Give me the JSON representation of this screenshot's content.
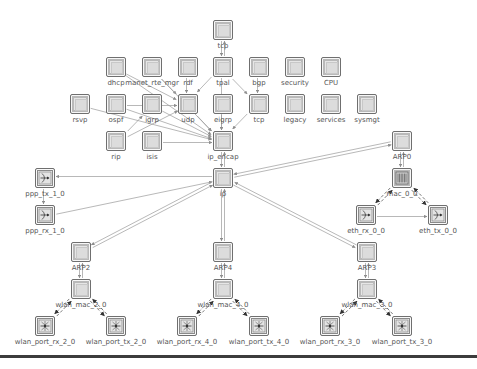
{
  "diagram": {
    "nodes": [
      {
        "id": "top",
        "label": "tcp",
        "x": 213,
        "y": 20,
        "type": "module"
      },
      {
        "id": "dhcp",
        "label": "dhcp",
        "x": 106,
        "y": 57,
        "type": "module"
      },
      {
        "id": "manet",
        "label": "manet_rte_mgr",
        "x": 142,
        "y": 57,
        "type": "module"
      },
      {
        "id": "rdf",
        "label": "rdf",
        "x": 178,
        "y": 57,
        "type": "module"
      },
      {
        "id": "tpal",
        "label": "tpal",
        "x": 213,
        "y": 57,
        "type": "module"
      },
      {
        "id": "bgp",
        "label": "bgp",
        "x": 249,
        "y": 57,
        "type": "module"
      },
      {
        "id": "security",
        "label": "security",
        "x": 285,
        "y": 57,
        "type": "module"
      },
      {
        "id": "cpu",
        "label": "CPU",
        "x": 321,
        "y": 57,
        "type": "module"
      },
      {
        "id": "rsvp",
        "label": "rsvp",
        "x": 70,
        "y": 94,
        "type": "module"
      },
      {
        "id": "ospf",
        "label": "ospf",
        "x": 106,
        "y": 94,
        "type": "module"
      },
      {
        "id": "igrp",
        "label": "igrp",
        "x": 142,
        "y": 94,
        "type": "module"
      },
      {
        "id": "udp",
        "label": "udp",
        "x": 178,
        "y": 94,
        "type": "module"
      },
      {
        "id": "eigrp",
        "label": "eigrp",
        "x": 213,
        "y": 94,
        "type": "module"
      },
      {
        "id": "tcp",
        "label": "tcp",
        "x": 249,
        "y": 94,
        "type": "module"
      },
      {
        "id": "legacy",
        "label": "legacy",
        "x": 285,
        "y": 94,
        "type": "module"
      },
      {
        "id": "services",
        "label": "services",
        "x": 321,
        "y": 94,
        "type": "module"
      },
      {
        "id": "sysmgt",
        "label": "sysmgt",
        "x": 357,
        "y": 94,
        "type": "module"
      },
      {
        "id": "rip",
        "label": "rip",
        "x": 106,
        "y": 131,
        "type": "module"
      },
      {
        "id": "isis",
        "label": "isis",
        "x": 142,
        "y": 131,
        "type": "module"
      },
      {
        "id": "ip_encap",
        "label": "ip_encap",
        "x": 213,
        "y": 131,
        "type": "module"
      },
      {
        "id": "arp0",
        "label": "ARP0",
        "x": 392,
        "y": 131,
        "type": "module"
      },
      {
        "id": "ppp_tx",
        "label": "ppp_tx_1_0",
        "x": 35,
        "y": 168,
        "type": "ptx"
      },
      {
        "id": "ip",
        "label": "ip",
        "x": 213,
        "y": 168,
        "type": "module"
      },
      {
        "id": "mac00",
        "label": "mac_0_0",
        "x": 392,
        "y": 168,
        "type": "mac"
      },
      {
        "id": "ppp_rx",
        "label": "ppp_rx_1_0",
        "x": 35,
        "y": 205,
        "type": "prx"
      },
      {
        "id": "eth_rx",
        "label": "eth_rx_0_0",
        "x": 356,
        "y": 205,
        "type": "prx"
      },
      {
        "id": "eth_tx",
        "label": "eth_tx_0_0",
        "x": 428,
        "y": 205,
        "type": "ptx"
      },
      {
        "id": "arp2",
        "label": "ARP2",
        "x": 71,
        "y": 242,
        "type": "module"
      },
      {
        "id": "arp4",
        "label": "ARP4",
        "x": 213,
        "y": 242,
        "type": "module"
      },
      {
        "id": "arp3",
        "label": "ARP3",
        "x": 357,
        "y": 242,
        "type": "module"
      },
      {
        "id": "wmac2",
        "label": "wlan_mac_2_0",
        "x": 71,
        "y": 279,
        "type": "module"
      },
      {
        "id": "wmac4",
        "label": "wlan_mac_4_0",
        "x": 213,
        "y": 279,
        "type": "module"
      },
      {
        "id": "wmac3",
        "label": "wlan_mac_3_0",
        "x": 357,
        "y": 279,
        "type": "module"
      },
      {
        "id": "wrx2",
        "label": "wlan_port_rx_2_0",
        "x": 35,
        "y": 316,
        "type": "wrx"
      },
      {
        "id": "wtx2",
        "label": "wlan_port_tx_2_0",
        "x": 106,
        "y": 316,
        "type": "wtx"
      },
      {
        "id": "wrx4",
        "label": "wlan_port_rx_4_0",
        "x": 177,
        "y": 316,
        "type": "wrx"
      },
      {
        "id": "wtx4",
        "label": "wlan_port_tx_4_0",
        "x": 249,
        "y": 316,
        "type": "wtx"
      },
      {
        "id": "wrx3",
        "label": "wlan_port_rx_3_0",
        "x": 320,
        "y": 316,
        "type": "wrx"
      },
      {
        "id": "wtx3",
        "label": "wlan_port_tx_3_0",
        "x": 392,
        "y": 316,
        "type": "wtx"
      }
    ],
    "edges": [
      [
        "tpal",
        "top"
      ],
      [
        "top",
        "tpal"
      ],
      [
        "tpal",
        "udp"
      ],
      [
        "tpal",
        "tcp"
      ],
      [
        "tpal",
        "ip_encap"
      ],
      [
        "bgp",
        "tcp"
      ],
      [
        "rdf",
        "udp"
      ],
      [
        "dhcp",
        "udp"
      ],
      [
        "manet",
        "udp"
      ],
      [
        "dhcp",
        "ip_encap"
      ],
      [
        "manet",
        "ip_encap"
      ],
      [
        "udp",
        "ip_encap"
      ],
      [
        "eigrp",
        "ip_encap"
      ],
      [
        "tcp",
        "ip_encap"
      ],
      [
        "rsvp",
        "ip_encap"
      ],
      [
        "ospf",
        "ip_encap"
      ],
      [
        "igrp",
        "ip_encap"
      ],
      [
        "ospf",
        "udp"
      ],
      [
        "rip",
        "udp"
      ],
      [
        "isis",
        "ip_encap"
      ],
      [
        "rip",
        "igrp"
      ],
      [
        "ip_encap",
        "ip"
      ],
      [
        "ip",
        "ip_encap"
      ],
      [
        "ip",
        "arp0"
      ],
      [
        "arp0",
        "ip"
      ],
      [
        "ip",
        "ppp_tx"
      ],
      [
        "ppp_rx",
        "ip"
      ],
      [
        "ppp_tx",
        "ppp_rx"
      ],
      [
        "ip",
        "arp2"
      ],
      [
        "arp2",
        "ip"
      ],
      [
        "ip",
        "arp4"
      ],
      [
        "arp4",
        "ip"
      ],
      [
        "ip",
        "arp3"
      ],
      [
        "arp3",
        "ip"
      ],
      [
        "arp0",
        "mac00"
      ],
      [
        "mac00",
        "arp0"
      ],
      [
        "arp2",
        "wmac2"
      ],
      [
        "wmac2",
        "arp2"
      ],
      [
        "arp4",
        "wmac4"
      ],
      [
        "wmac4",
        "arp4"
      ],
      [
        "arp3",
        "wmac3"
      ],
      [
        "wmac3",
        "arp3"
      ],
      [
        "eth_rx",
        "eth_tx"
      ]
    ],
    "stat_edges": [
      [
        "mac00",
        "eth_rx"
      ],
      [
        "mac00",
        "eth_tx"
      ],
      [
        "eth_tx",
        "mac00"
      ],
      [
        "eth_rx",
        "mac00"
      ],
      [
        "wmac2",
        "wrx2"
      ],
      [
        "wmac2",
        "wtx2"
      ],
      [
        "wtx2",
        "wmac2"
      ],
      [
        "wrx2",
        "wmac2"
      ],
      [
        "wmac4",
        "wrx4"
      ],
      [
        "wmac4",
        "wtx4"
      ],
      [
        "wtx4",
        "wmac4"
      ],
      [
        "wrx4",
        "wmac4"
      ],
      [
        "wmac3",
        "wrx3"
      ],
      [
        "wmac3",
        "wtx3"
      ],
      [
        "wtx3",
        "wmac3"
      ],
      [
        "wrx3",
        "wmac3"
      ]
    ]
  },
  "colors": {
    "edge": "#9a9a9a",
    "stat_edge": "#555555",
    "node_border": "#6f6f6f",
    "node_fill": "#e6e6e6",
    "bottom_bar": "#3c3c3c"
  }
}
